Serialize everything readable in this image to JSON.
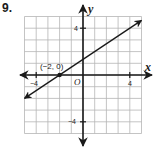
{
  "problem": {
    "number": "9."
  },
  "graph": {
    "x_axis_label": "x",
    "y_axis_label": "y",
    "origin_label": "O",
    "x_range": [
      -5,
      5
    ],
    "y_range": [
      -5,
      5
    ],
    "grid_step": 1,
    "tick_labels": {
      "x_neg": "−4",
      "x_pos": "4",
      "y_pos": "4",
      "y_neg": "−4"
    },
    "line": {
      "slope": 0.6667,
      "y_intercept": 1.3333,
      "from": [
        -5,
        -2
      ],
      "to": [
        5,
        4.67
      ],
      "arrows": "both"
    },
    "labeled_point": {
      "x": -2,
      "y": 0,
      "label": "(−2, 0)"
    },
    "colors": {
      "grid": "#b5b5b5",
      "axes": "#1a1a1a",
      "line": "#1a1a1a"
    }
  }
}
